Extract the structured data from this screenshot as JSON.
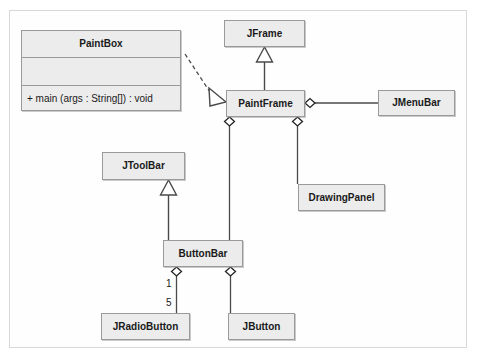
{
  "diagram": {
    "type": "uml-class-diagram",
    "colors": {
      "class_fill": "#ececec",
      "class_border": "#9a9a9a",
      "line": "#4a4a4a",
      "text": "#1a1a1a",
      "canvas_border": "#d8d8d8",
      "canvas_background": "#fefefe"
    },
    "classes": [
      {
        "id": "paintbox",
        "name": "PaintBox",
        "attributes": [],
        "operations": [
          "+ main (args : String[]) : void"
        ]
      },
      {
        "id": "jframe",
        "name": "JFrame"
      },
      {
        "id": "paintframe",
        "name": "PaintFrame"
      },
      {
        "id": "jmenubar",
        "name": "JMenuBar"
      },
      {
        "id": "drawingpanel",
        "name": "DrawingPanel"
      },
      {
        "id": "jtoolbar",
        "name": "JToolBar"
      },
      {
        "id": "buttonbar",
        "name": "ButtonBar"
      },
      {
        "id": "jradiobutton",
        "name": "JRadioButton"
      },
      {
        "id": "jbutton",
        "name": "JButton"
      }
    ],
    "relationships": [
      {
        "id": "paintbox-paintframe",
        "kind": "dependency",
        "style": "dashed",
        "arrow": "hollow-triangle",
        "from": "paintbox",
        "to": "paintframe"
      },
      {
        "id": "paintframe-jframe",
        "kind": "generalization",
        "style": "solid",
        "arrow": "hollow-triangle",
        "from": "paintframe",
        "to": "jframe"
      },
      {
        "id": "paintframe-jmenubar",
        "kind": "aggregation",
        "style": "solid",
        "arrow": "hollow-diamond",
        "from": "paintframe",
        "to": "jmenubar"
      },
      {
        "id": "paintframe-drawingpanel",
        "kind": "aggregation",
        "style": "solid",
        "arrow": "hollow-diamond",
        "from": "paintframe",
        "to": "drawingpanel"
      },
      {
        "id": "paintframe-buttonbar",
        "kind": "aggregation",
        "style": "solid",
        "arrow": "hollow-diamond",
        "from": "paintframe",
        "to": "buttonbar"
      },
      {
        "id": "buttonbar-jtoolbar",
        "kind": "generalization",
        "style": "solid",
        "arrow": "hollow-triangle",
        "from": "buttonbar",
        "to": "jtoolbar"
      },
      {
        "id": "buttonbar-jradiobutton",
        "kind": "aggregation",
        "style": "solid",
        "arrow": "hollow-diamond",
        "from": "buttonbar",
        "to": "jradiobutton",
        "source_multiplicity": "1",
        "target_multiplicity": "5"
      },
      {
        "id": "buttonbar-jbutton",
        "kind": "aggregation",
        "style": "solid",
        "arrow": "hollow-diamond",
        "from": "buttonbar",
        "to": "jbutton"
      }
    ],
    "multiplicities": {
      "buttonbar_end": "1",
      "jradiobutton_end": "5"
    }
  }
}
